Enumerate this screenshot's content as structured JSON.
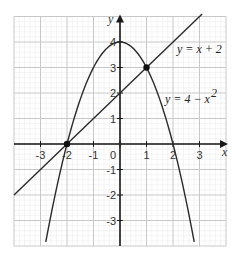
{
  "chart_data": {
    "type": "line",
    "title": "",
    "xlabel": "x",
    "ylabel": "y",
    "xlim": [
      -4,
      4
    ],
    "ylim": [
      -4,
      5
    ],
    "grid": true,
    "x_ticks": [
      -3,
      -2,
      -1,
      0,
      1,
      2,
      3
    ],
    "y_ticks": [
      -3,
      -2,
      -1,
      1,
      2,
      3,
      4
    ],
    "x_tick_labels": [
      "-3",
      "-2",
      "-1",
      "0",
      "1",
      "2",
      "3"
    ],
    "y_tick_labels": [
      "-3",
      "-2",
      "-1",
      "1",
      "2",
      "3",
      "4"
    ],
    "series": [
      {
        "name": "y = x + 2",
        "expression": "x + 2",
        "x_range": [
          -4,
          3.1
        ],
        "label": "y = x + 2"
      },
      {
        "name": "y = 4 − x²",
        "expression": "4 - x^2",
        "x_range": [
          -2.8,
          2.8
        ],
        "label": "y = 4 − x",
        "label_sup": "2"
      }
    ],
    "points": [
      {
        "x": -2,
        "y": 0,
        "label": "intersection"
      },
      {
        "x": 1,
        "y": 3,
        "label": "intersection"
      }
    ]
  },
  "colors": {
    "axis": "#1a1a1a",
    "curve": "#2a2a2a",
    "grid_major": "#c8c8c8",
    "grid_minor": "#ececec"
  }
}
